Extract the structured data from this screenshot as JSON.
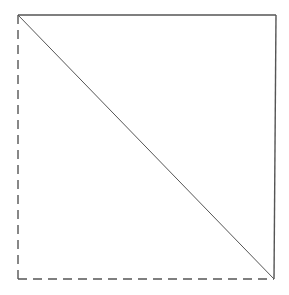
{
  "diagram": {
    "type": "square-with-diagonal",
    "canvas": {
      "width": 289,
      "height": 295,
      "background": "#ffffff"
    },
    "stroke_color": "#555555",
    "vertices": {
      "top_left": [
        18,
        15
      ],
      "top_right": [
        276,
        15
      ],
      "bottom_right": [
        274,
        279
      ],
      "bottom_left": [
        18,
        279
      ]
    },
    "edges": [
      {
        "name": "top-edge",
        "from": "top_left",
        "to": "top_right",
        "style": "solid"
      },
      {
        "name": "right-edge",
        "from": "top_right",
        "to": "bottom_right",
        "style": "solid"
      },
      {
        "name": "bottom-edge",
        "from": "bottom_left",
        "to": "bottom_right",
        "style": "dashed"
      },
      {
        "name": "left-edge",
        "from": "top_left",
        "to": "bottom_left",
        "style": "dashed"
      },
      {
        "name": "diagonal",
        "from": "top_left",
        "to": "bottom_right",
        "style": "solid"
      }
    ],
    "labels": []
  }
}
